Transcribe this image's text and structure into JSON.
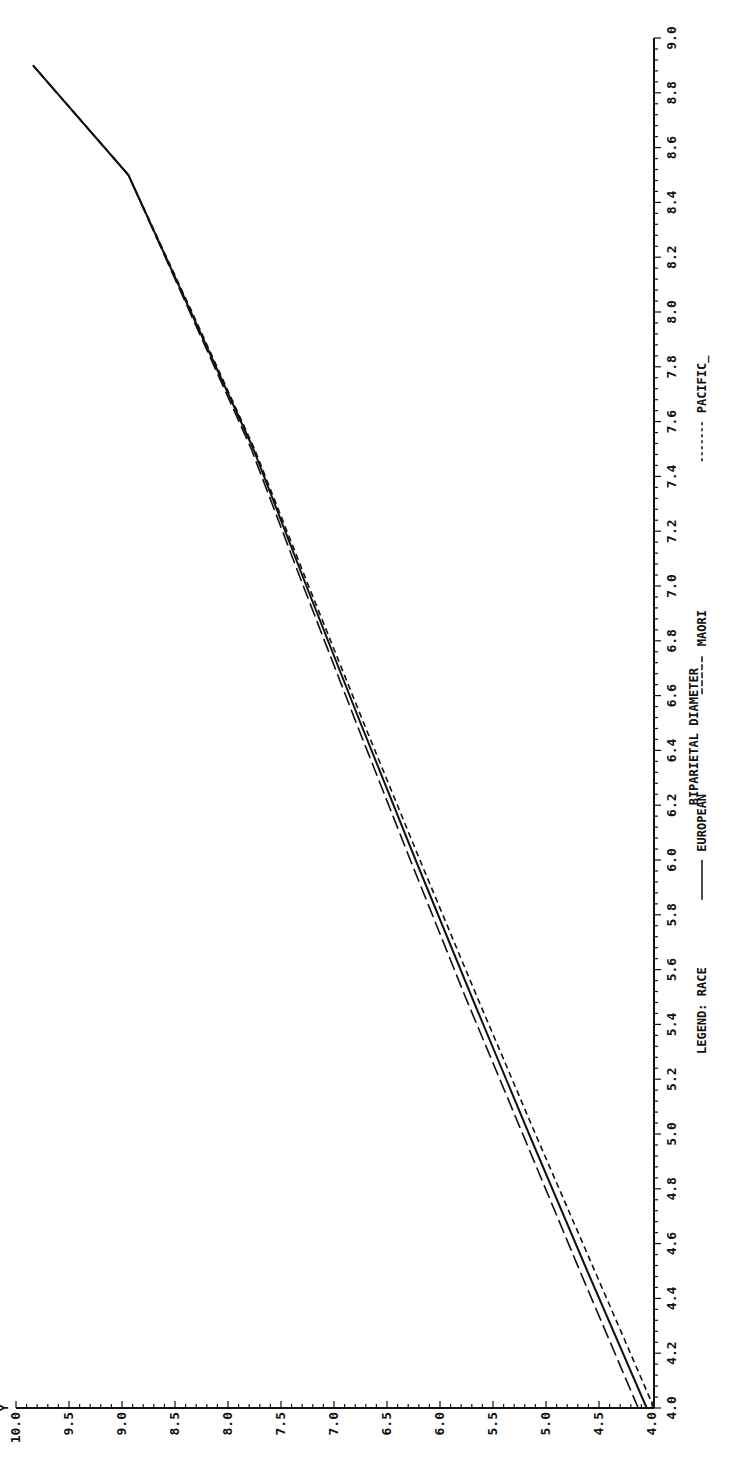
{
  "chart_data": {
    "type": "line",
    "orientation_note": "figure rotated 90deg counter-clockwise on page",
    "title": "",
    "xlabel": "BIPARIETAL DIAMETER",
    "ylabel": "Y",
    "xlim": [
      4.0,
      9.0
    ],
    "ylim": [
      4.0,
      10.0
    ],
    "x_ticks": [
      "4.0",
      "4.2",
      "4.4",
      "4.6",
      "4.8",
      "5.0",
      "5.2",
      "5.4",
      "5.6",
      "5.8",
      "6.0",
      "6.2",
      "6.4",
      "6.6",
      "6.8",
      "7.0",
      "7.2",
      "7.4",
      "7.6",
      "7.8",
      "8.0",
      "8.2",
      "8.4",
      "8.6",
      "8.8",
      "9.0"
    ],
    "y_ticks": [
      "4.0",
      "4.5",
      "5.0",
      "5.5",
      "6.0",
      "6.5",
      "7.0",
      "7.5",
      "8.0",
      "8.5",
      "9.0",
      "9.5",
      "10.0"
    ],
    "grid": false,
    "legend": {
      "title": "LEGEND: RACE",
      "entries": [
        {
          "label": "EUROPEAN",
          "style": "solid"
        },
        {
          "label": "MAORI",
          "style": "long-dash"
        },
        {
          "label": "PACIFIC_",
          "style": "short-dash"
        }
      ],
      "position": "below x-axis"
    },
    "x": [
      4.0,
      4.5,
      5.0,
      5.5,
      6.0,
      6.5,
      7.0,
      7.5,
      8.0,
      8.5,
      8.9
    ],
    "series": [
      {
        "name": "EUROPEAN",
        "style": "solid",
        "values": [
          4.05,
          4.61,
          5.16,
          5.7,
          6.23,
          6.75,
          7.26,
          7.76,
          8.35,
          8.94,
          9.84
        ]
      },
      {
        "name": "MAORI",
        "style": "long-dash",
        "values": [
          4.13,
          4.68,
          5.22,
          5.76,
          6.28,
          6.79,
          7.29,
          7.78,
          8.36,
          8.94,
          9.84
        ]
      },
      {
        "name": "PACIFIC_",
        "style": "short-dash",
        "values": [
          3.98,
          4.54,
          5.1,
          5.65,
          6.19,
          6.72,
          7.24,
          7.75,
          8.34,
          8.94,
          9.84
        ]
      }
    ]
  }
}
